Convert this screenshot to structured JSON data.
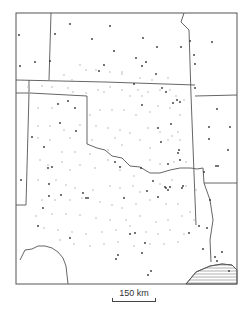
{
  "map": {
    "title": "",
    "scale_label": "150 km",
    "colors": {
      "boundary": "#555555",
      "station_dark": "#333333",
      "station_light": "#b5b5b5",
      "hatch": "#777777"
    },
    "frame": {
      "x": 16,
      "y": 13,
      "w": 221,
      "h": 271
    },
    "boundaries": [
      "M16,80 L105,82 L195,85",
      "M51,13 L49,80",
      "M184,13 L181,22 L189,30 L191,95",
      "M191,95 L196,225",
      "M195,96 L237,95",
      "M29,80 L29,93 L16,93",
      "M30,93 L87,96 L87,144 L97,148",
      "M29,93 L26,205 L16,205",
      "M97,148 L105,150 L112,156 L122,158 L130,166 L140,167 L150,173 L160,173 L170,170 L180,168 L190,168 L197,169 L203,168",
      "M203,168 L204,183 L237,183",
      "M204,183 L210,200 L213,220 L210,240 L211,262",
      "M20,260 L25,250 L32,249 L38,246 L45,246 L52,248 L58,252 L63,258 L66,266 L68,284",
      "M186,284 L196,272 L210,266 L222,264 L232,265 L237,270"
    ],
    "hatched_region": "M186,284 L196,272 L210,266 L222,264 L232,265 L237,270 L237,284 Z",
    "stations_dark": [
      [
        19,
        35
      ],
      [
        20,
        66
      ],
      [
        55,
        34
      ],
      [
        35,
        62
      ],
      [
        50,
        61
      ],
      [
        21,
        180
      ],
      [
        32,
        137
      ],
      [
        49,
        184
      ],
      [
        49,
        196
      ],
      [
        38,
        226
      ],
      [
        43,
        208
      ],
      [
        70,
        24
      ],
      [
        92,
        39
      ],
      [
        114,
        51
      ],
      [
        104,
        65
      ],
      [
        99,
        71
      ],
      [
        75,
        108
      ],
      [
        58,
        104
      ],
      [
        60,
        123
      ],
      [
        76,
        131
      ],
      [
        68,
        101
      ],
      [
        110,
        26
      ],
      [
        143,
        38
      ],
      [
        157,
        47
      ],
      [
        136,
        58
      ],
      [
        134,
        84
      ],
      [
        142,
        105
      ],
      [
        156,
        74
      ],
      [
        162,
        88
      ],
      [
        146,
        62
      ],
      [
        142,
        66
      ],
      [
        166,
        92
      ],
      [
        181,
        47
      ],
      [
        194,
        55
      ],
      [
        195,
        64
      ],
      [
        190,
        41
      ],
      [
        195,
        88
      ],
      [
        212,
        42
      ],
      [
        217,
        109
      ],
      [
        209,
        127
      ],
      [
        230,
        127
      ],
      [
        173,
        103
      ],
      [
        180,
        102
      ],
      [
        177,
        100
      ],
      [
        168,
        164
      ],
      [
        179,
        150
      ],
      [
        158,
        128
      ],
      [
        171,
        124
      ],
      [
        161,
        142
      ],
      [
        204,
        172
      ],
      [
        228,
        150
      ],
      [
        218,
        166
      ],
      [
        216,
        166
      ],
      [
        215,
        257
      ],
      [
        222,
        252
      ],
      [
        217,
        261
      ],
      [
        229,
        271
      ],
      [
        115,
        162
      ],
      [
        120,
        167
      ],
      [
        141,
        168
      ],
      [
        153,
        181
      ],
      [
        165,
        187
      ],
      [
        170,
        187
      ],
      [
        168,
        190
      ],
      [
        166,
        188
      ],
      [
        147,
        191
      ],
      [
        158,
        197
      ],
      [
        182,
        188
      ],
      [
        183,
        186
      ],
      [
        210,
        200
      ],
      [
        124,
        198
      ],
      [
        145,
        243
      ],
      [
        142,
        253
      ],
      [
        135,
        233
      ],
      [
        130,
        234
      ],
      [
        189,
        233
      ],
      [
        151,
        271
      ],
      [
        148,
        275
      ],
      [
        199,
        226
      ],
      [
        207,
        228
      ],
      [
        203,
        249
      ],
      [
        116,
        259
      ],
      [
        118,
        255
      ],
      [
        44,
        147
      ],
      [
        52,
        167
      ],
      [
        48,
        168
      ],
      [
        61,
        195
      ],
      [
        70,
        238
      ],
      [
        83,
        193
      ],
      [
        88,
        198
      ],
      [
        86,
        198
      ],
      [
        178,
        153
      ],
      [
        180,
        160
      ],
      [
        209,
        139
      ]
    ],
    "stations_light": [
      [
        28,
        87
      ],
      [
        42,
        86
      ],
      [
        52,
        87
      ],
      [
        68,
        88
      ],
      [
        86,
        93
      ],
      [
        98,
        90
      ],
      [
        110,
        87
      ],
      [
        122,
        90
      ],
      [
        138,
        90
      ],
      [
        148,
        92
      ],
      [
        160,
        90
      ],
      [
        170,
        90
      ],
      [
        80,
        65
      ],
      [
        86,
        70
      ],
      [
        110,
        72
      ],
      [
        122,
        74
      ],
      [
        96,
        70
      ],
      [
        73,
        92
      ],
      [
        104,
        92
      ],
      [
        38,
        108
      ],
      [
        52,
        108
      ],
      [
        90,
        115
      ],
      [
        100,
        110
      ],
      [
        112,
        110
      ],
      [
        124,
        110
      ],
      [
        136,
        115
      ],
      [
        150,
        112
      ],
      [
        158,
        106
      ],
      [
        170,
        108
      ],
      [
        180,
        115
      ],
      [
        38,
        126
      ],
      [
        50,
        126
      ],
      [
        64,
        130
      ],
      [
        80,
        125
      ],
      [
        96,
        126
      ],
      [
        108,
        128
      ],
      [
        120,
        130
      ],
      [
        130,
        133
      ],
      [
        148,
        128
      ],
      [
        160,
        132
      ],
      [
        172,
        136
      ],
      [
        180,
        140
      ],
      [
        38,
        138
      ],
      [
        50,
        140
      ],
      [
        70,
        138
      ],
      [
        92,
        140
      ],
      [
        115,
        138
      ],
      [
        122,
        145
      ],
      [
        140,
        140
      ],
      [
        150,
        148
      ],
      [
        168,
        140
      ],
      [
        178,
        132
      ],
      [
        40,
        160
      ],
      [
        48,
        165
      ],
      [
        62,
        162
      ],
      [
        70,
        170
      ],
      [
        80,
        165
      ],
      [
        95,
        168
      ],
      [
        108,
        160
      ],
      [
        120,
        170
      ],
      [
        134,
        176
      ],
      [
        150,
        160
      ],
      [
        160,
        164
      ],
      [
        174,
        162
      ],
      [
        186,
        162
      ],
      [
        192,
        168
      ],
      [
        38,
        180
      ],
      [
        56,
        180
      ],
      [
        66,
        185
      ],
      [
        75,
        188
      ],
      [
        93,
        190
      ],
      [
        110,
        186
      ],
      [
        120,
        188
      ],
      [
        133,
        186
      ],
      [
        140,
        192
      ],
      [
        160,
        184
      ],
      [
        172,
        180
      ],
      [
        186,
        186
      ],
      [
        196,
        190
      ],
      [
        42,
        200
      ],
      [
        55,
        200
      ],
      [
        70,
        200
      ],
      [
        82,
        198
      ],
      [
        100,
        202
      ],
      [
        112,
        205
      ],
      [
        122,
        208
      ],
      [
        136,
        204
      ],
      [
        150,
        200
      ],
      [
        166,
        204
      ],
      [
        178,
        204
      ],
      [
        190,
        212
      ],
      [
        36,
        216
      ],
      [
        52,
        214
      ],
      [
        66,
        214
      ],
      [
        80,
        215
      ],
      [
        96,
        218
      ],
      [
        110,
        220
      ],
      [
        126,
        220
      ],
      [
        140,
        216
      ],
      [
        156,
        222
      ],
      [
        168,
        220
      ],
      [
        182,
        216
      ],
      [
        194,
        220
      ],
      [
        44,
        228
      ],
      [
        58,
        230
      ],
      [
        72,
        232
      ],
      [
        86,
        234
      ],
      [
        102,
        232
      ],
      [
        116,
        230
      ],
      [
        130,
        226
      ],
      [
        146,
        232
      ],
      [
        158,
        234
      ],
      [
        170,
        230
      ],
      [
        184,
        234
      ],
      [
        60,
        240
      ],
      [
        74,
        244
      ],
      [
        90,
        246
      ],
      [
        104,
        244
      ],
      [
        118,
        242
      ],
      [
        134,
        246
      ],
      [
        150,
        244
      ],
      [
        164,
        244
      ],
      [
        178,
        242
      ],
      [
        122,
        72
      ],
      [
        140,
        78
      ],
      [
        152,
        80
      ],
      [
        168,
        78
      ],
      [
        64,
        75
      ],
      [
        72,
        80
      ],
      [
        130,
        96
      ],
      [
        142,
        96
      ],
      [
        176,
        96
      ],
      [
        184,
        100
      ],
      [
        75,
        152
      ],
      [
        90,
        154
      ],
      [
        108,
        150
      ],
      [
        62,
        152
      ]
    ]
  }
}
